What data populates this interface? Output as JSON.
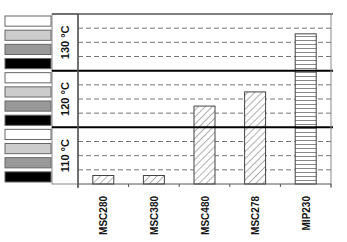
{
  "chart_data": {
    "type": "bar",
    "title": "",
    "xlabel": "",
    "ylabel": "",
    "categories": [
      "MSC280",
      "MSC380",
      "MSC480",
      "MSC278",
      "MIP230"
    ],
    "values": [
      0.6,
      0.6,
      5.5,
      6.5,
      10.6
    ],
    "value_units": "relative level (4 units per temperature band)",
    "ylim": [
      0,
      12
    ],
    "bands": [
      {
        "label": "110 °C",
        "range": [
          0,
          4
        ]
      },
      {
        "label": "120 °C",
        "range": [
          4,
          8
        ]
      },
      {
        "label": "130 °C",
        "range": [
          8,
          12
        ]
      }
    ],
    "band_legend_swatches": [
      "#ffffff",
      "#cccccc",
      "#999999",
      "#000000"
    ],
    "patterns": [
      "diagonal",
      "diagonal",
      "diagonal",
      "diagonal",
      "horizontal"
    ],
    "grid": true,
    "grid_style": "dashed minor lines within bands, solid lines between bands",
    "legend": "left"
  }
}
